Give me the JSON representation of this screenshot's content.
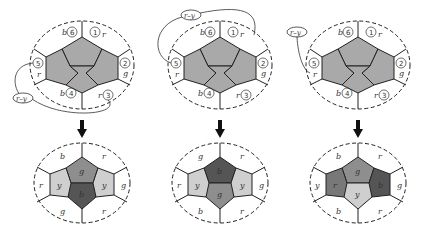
{
  "figure": {
    "top_row": [
      {
        "id": "A",
        "link_label": "r–y",
        "regions": [
          {
            "num": "1",
            "color": "r"
          },
          {
            "num": "2",
            "color": "g"
          },
          {
            "num": "3",
            "color": "r"
          },
          {
            "num": "4",
            "color": "b"
          },
          {
            "num": "5",
            "color": "r"
          },
          {
            "num": "6",
            "color": "b"
          }
        ]
      },
      {
        "id": "B",
        "link_label": "r–y",
        "regions": [
          {
            "num": "1",
            "color": "r"
          },
          {
            "num": "2",
            "color": "g"
          },
          {
            "num": "3",
            "color": "r"
          },
          {
            "num": "4",
            "color": "b"
          },
          {
            "num": "5",
            "color": "r"
          },
          {
            "num": "6",
            "color": "b"
          }
        ]
      },
      {
        "id": "C",
        "link_label": "r–y",
        "regions": [
          {
            "num": "1",
            "color": "r"
          },
          {
            "num": "2",
            "color": "g"
          },
          {
            "num": "3",
            "color": "r"
          },
          {
            "num": "4",
            "color": "b"
          },
          {
            "num": "5",
            "color": "r"
          },
          {
            "num": "6",
            "color": "b"
          }
        ]
      }
    ],
    "bottom_row": [
      {
        "outer": {
          "top_left": "b",
          "top_right": "r",
          "right": "g",
          "bottom_right": "r",
          "bottom_left": "g",
          "left": "r"
        },
        "inner": {
          "top": "g",
          "left": "y",
          "right": "y",
          "bottom": "b"
        }
      },
      {
        "outer": {
          "top_left": "g",
          "top_right": "r",
          "right": "g",
          "bottom_right": "r",
          "bottom_left": "b",
          "left": "r"
        },
        "inner": {
          "top": "b",
          "left": "y",
          "right": "y",
          "bottom": "g"
        }
      },
      {
        "outer": {
          "top_left": "b",
          "top_right": "r",
          "right": "g",
          "bottom_right": "r",
          "bottom_left": "b",
          "left": "y"
        },
        "inner": {
          "top": "g",
          "left": "r",
          "right": "b",
          "bottom": "y"
        }
      }
    ],
    "fill_colors": {
      "uncolored": "#a9a9a9",
      "b": "#555555",
      "g": "#8e8e8e",
      "y": "#cfcfcf",
      "r": "#787878"
    }
  }
}
